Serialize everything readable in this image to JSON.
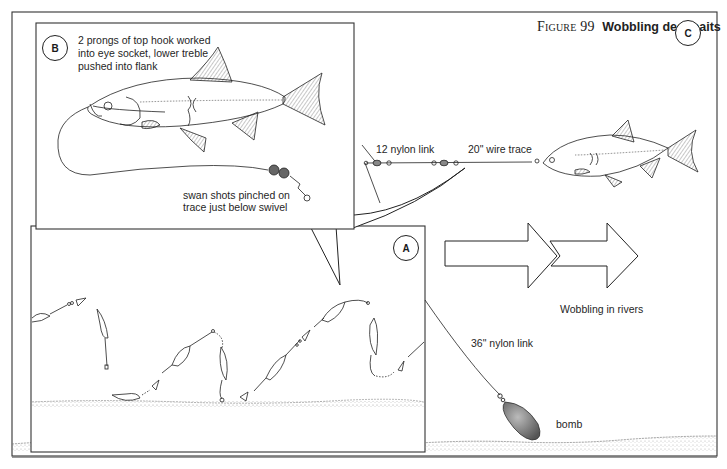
{
  "figure": {
    "number_label": "Figure 99",
    "title": "Wobbling deadbaits"
  },
  "panels": {
    "a": {
      "badge": "A",
      "description": "Wobbling motion sequence of deadbait over river bed"
    },
    "b": {
      "badge": "B",
      "caption_lines": [
        "2 prongs of top hook worked",
        "into eye socket, lower treble",
        "pushed into flank"
      ],
      "shots_lines": [
        "swan shots pinched on",
        "trace just below swivel"
      ]
    },
    "c": {
      "badge": "C",
      "labels": {
        "nylon_link_12": "12 nylon link",
        "wire_trace": "20\" wire trace",
        "wobbling": "Wobbling in rivers",
        "nylon_link_36": "36\" nylon link",
        "bomb": "bomb"
      }
    }
  },
  "colors": {
    "ink": "#1f1f1f",
    "paper": "#ffffff",
    "bomb_fill": "#7a7a7a",
    "riverbed_stipple": "#9a9a9a"
  }
}
